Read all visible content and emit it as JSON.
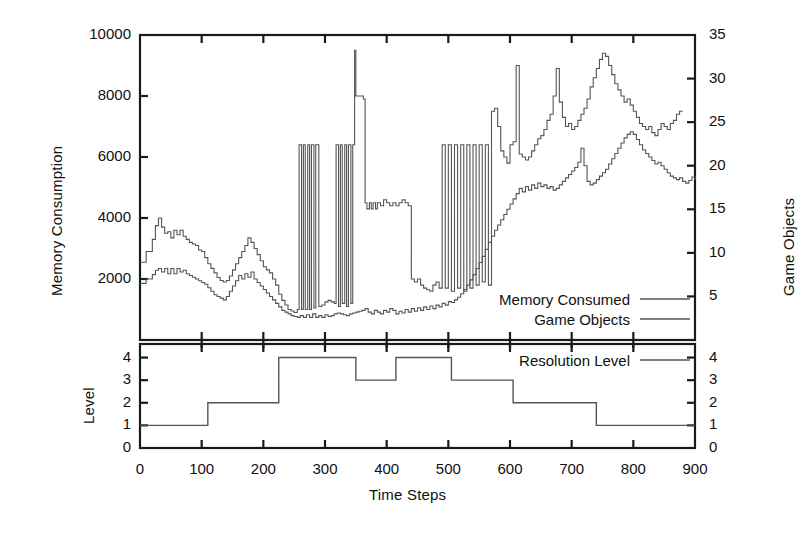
{
  "chart_data": {
    "type": "line",
    "title": "",
    "panels": [
      {
        "name": "upper-panel",
        "xlabel": "",
        "ylabel_left": "Memory Consumption",
        "ylabel_right": "Game Objects",
        "xlim": [
          0,
          900
        ],
        "ylim_left": [
          0,
          10000
        ],
        "ylim_right": [
          0,
          35
        ],
        "yticks_left": [
          2000,
          4000,
          6000,
          8000,
          10000
        ],
        "ytick_labels_left": [
          "2000",
          "4000",
          "6000",
          "8000",
          "10000"
        ],
        "yticks_right": [
          5,
          10,
          15,
          20,
          25,
          30,
          35
        ],
        "ytick_labels_right": [
          "5",
          "10",
          "15",
          "20",
          "25",
          "30",
          "35"
        ],
        "grid": false,
        "legend_position": "inside-bottom-right",
        "series": [
          {
            "name": "Memory Consumed",
            "axis": "left",
            "x": [
              0,
              10,
              20,
              25,
              30,
              35,
              40,
              45,
              50,
              55,
              60,
              65,
              70,
              75,
              80,
              85,
              90,
              95,
              100,
              105,
              110,
              115,
              120,
              125,
              130,
              135,
              140,
              145,
              150,
              155,
              160,
              165,
              170,
              175,
              180,
              185,
              190,
              195,
              200,
              205,
              210,
              215,
              220,
              225,
              230,
              235,
              240,
              245,
              250,
              255,
              258,
              262,
              265,
              268,
              272,
              275,
              278,
              282,
              285,
              290,
              295,
              300,
              305,
              310,
              315,
              318,
              322,
              325,
              328,
              332,
              335,
              338,
              342,
              345,
              348,
              350,
              352,
              355,
              358,
              362,
              365,
              368,
              372,
              375,
              378,
              382,
              385,
              390,
              395,
              400,
              405,
              410,
              415,
              420,
              425,
              430,
              435,
              440,
              445,
              450,
              455,
              460,
              465,
              470,
              475,
              480,
              485,
              490,
              495,
              500,
              505,
              510,
              515,
              520,
              525,
              530,
              535,
              540,
              545,
              550,
              555,
              560,
              565,
              570,
              575,
              580,
              585,
              590,
              595,
              600,
              605,
              610,
              615,
              620,
              625,
              630,
              635,
              640,
              645,
              650,
              655,
              660,
              665,
              670,
              675,
              680,
              685,
              690,
              695,
              700,
              705,
              710,
              715,
              720,
              725,
              730,
              735,
              740,
              745,
              750,
              755,
              760,
              765,
              770,
              775,
              780,
              785,
              790,
              795,
              800,
              805,
              810,
              815,
              820,
              825,
              830,
              835,
              840,
              845,
              850,
              855,
              860,
              865,
              870,
              875,
              880,
              885,
              890,
              895,
              900
            ],
            "y": [
              2550,
              2900,
              3300,
              3750,
              4000,
              3700,
              3500,
              3550,
              3350,
              3600,
              3450,
              3600,
              3400,
              3300,
              3200,
              3150,
              3100,
              2950,
              2900,
              2700,
              2500,
              2350,
              2200,
              2050,
              1950,
              1900,
              1950,
              2100,
              2300,
              2500,
              2700,
              2900,
              3100,
              3350,
              3200,
              3000,
              2800,
              2600,
              2400,
              2300,
              2200,
              2000,
              1800,
              1500,
              1300,
              1150,
              1000,
              950,
              900,
              1000,
              6400,
              1000,
              6400,
              1000,
              6400,
              1000,
              6400,
              1050,
              6400,
              1100,
              1150,
              1250,
              1300,
              1250,
              1200,
              6400,
              1100,
              6400,
              1200,
              6400,
              1100,
              6400,
              1200,
              6400,
              9500,
              8000,
              8000,
              8000,
              8000,
              7900,
              4500,
              4300,
              4500,
              4300,
              4500,
              4300,
              4500,
              4400,
              4600,
              4500,
              4400,
              4500,
              4400,
              4500,
              4600,
              4500,
              4400,
              2000,
              1900,
              2000,
              1800,
              1700,
              1650,
              1600,
              1800,
              1900,
              1700,
              6400,
              1700,
              6400,
              1600,
              6400,
              1700,
              6400,
              1600,
              6400,
              1700,
              6400,
              1800,
              6400,
              1900,
              6400,
              1800,
              7500,
              7600,
              7000,
              6200,
              6000,
              5800,
              6400,
              6500,
              9000,
              6100,
              6000,
              5900,
              6000,
              6200,
              6400,
              6600,
              6700,
              6900,
              7200,
              7400,
              8000,
              8900,
              7800,
              7300,
              7000,
              7100,
              6900,
              7000,
              7200,
              7400,
              7600,
              7900,
              8300,
              8600,
              8900,
              9200,
              9400,
              9300,
              9000,
              8700,
              8400,
              8200,
              8000,
              7800,
              7900,
              7700,
              7500,
              7300,
              7100,
              7000,
              6900,
              7000,
              6800,
              6700,
              6900,
              7100,
              7000,
              6900,
              7100,
              7200,
              7400,
              7500
            ],
            "style": "solid"
          },
          {
            "name": "Game Objects",
            "axis": "right",
            "x": [
              0,
              10,
              20,
              25,
              30,
              35,
              40,
              45,
              50,
              55,
              60,
              65,
              70,
              75,
              80,
              85,
              90,
              95,
              100,
              105,
              110,
              115,
              120,
              125,
              130,
              135,
              140,
              145,
              150,
              155,
              160,
              165,
              170,
              175,
              180,
              185,
              190,
              195,
              200,
              205,
              210,
              215,
              220,
              225,
              230,
              235,
              240,
              245,
              250,
              255,
              260,
              265,
              270,
              275,
              280,
              285,
              290,
              295,
              300,
              305,
              310,
              315,
              320,
              325,
              330,
              335,
              340,
              345,
              350,
              355,
              360,
              365,
              370,
              375,
              380,
              385,
              390,
              395,
              400,
              405,
              410,
              415,
              420,
              425,
              430,
              435,
              440,
              445,
              450,
              455,
              460,
              465,
              470,
              475,
              480,
              485,
              490,
              495,
              500,
              505,
              510,
              515,
              520,
              525,
              530,
              535,
              540,
              545,
              550,
              555,
              560,
              565,
              570,
              575,
              580,
              585,
              590,
              595,
              600,
              605,
              610,
              615,
              620,
              625,
              630,
              635,
              640,
              645,
              650,
              655,
              660,
              665,
              670,
              675,
              680,
              685,
              690,
              695,
              700,
              705,
              710,
              715,
              720,
              725,
              730,
              735,
              740,
              745,
              750,
              755,
              760,
              765,
              770,
              775,
              780,
              785,
              790,
              795,
              800,
              805,
              810,
              815,
              820,
              825,
              830,
              835,
              840,
              845,
              850,
              855,
              860,
              865,
              870,
              875,
              880,
              885,
              890,
              895,
              900
            ],
            "y": [
              6.5,
              7.0,
              7.5,
              8.0,
              8.2,
              7.8,
              8.2,
              7.6,
              8.2,
              7.6,
              8.2,
              7.8,
              8.0,
              7.6,
              7.4,
              7.2,
              7.0,
              6.8,
              6.6,
              6.4,
              6.0,
              5.6,
              5.2,
              5.0,
              4.8,
              4.6,
              5.0,
              5.6,
              6.2,
              6.8,
              7.4,
              7.0,
              7.6,
              7.2,
              7.8,
              7.0,
              6.6,
              6.2,
              5.8,
              5.4,
              5.0,
              4.6,
              4.2,
              3.8,
              3.4,
              3.2,
              3.0,
              2.8,
              2.7,
              2.6,
              2.8,
              2.6,
              2.9,
              2.6,
              3.0,
              2.6,
              2.8,
              2.6,
              2.9,
              2.7,
              2.8,
              3.0,
              3.1,
              3.0,
              2.9,
              2.8,
              3.0,
              3.1,
              3.2,
              3.3,
              3.4,
              3.6,
              3.2,
              3.0,
              3.4,
              3.2,
              3.0,
              3.4,
              3.2,
              3.6,
              3.4,
              3.0,
              3.3,
              3.1,
              3.5,
              3.2,
              3.6,
              3.3,
              3.7,
              3.4,
              3.8,
              3.5,
              3.9,
              3.6,
              4.0,
              3.8,
              4.2,
              4.0,
              4.4,
              4.3,
              4.6,
              4.9,
              5.3,
              5.8,
              6.3,
              6.9,
              7.5,
              8.2,
              8.9,
              9.6,
              10.4,
              11.2,
              11.9,
              12.6,
              13.2,
              13.8,
              14.4,
              15.0,
              15.6,
              16.2,
              16.8,
              17.4,
              17.0,
              17.6,
              17.2,
              17.8,
              17.4,
              18.0,
              17.6,
              17.8,
              17.4,
              17.6,
              17.2,
              17.4,
              17.8,
              18.2,
              18.6,
              19.0,
              19.4,
              19.8,
              20.4,
              22.0,
              20.0,
              18.2,
              17.8,
              18.0,
              18.4,
              18.8,
              19.2,
              19.6,
              20.2,
              20.8,
              21.4,
              22.0,
              22.6,
              23.2,
              23.6,
              23.9,
              23.6,
              23.0,
              22.4,
              21.8,
              21.4,
              21.0,
              20.6,
              20.2,
              20.4,
              20.0,
              19.6,
              19.2,
              18.8,
              18.6,
              18.4,
              18.6,
              18.2,
              18.0,
              18.3,
              18.7,
              18.4,
              18.2,
              18.6,
              18.9,
              19.2,
              19.4
            ],
            "style": "solid"
          }
        ]
      },
      {
        "name": "lower-panel",
        "xlabel": "Time Steps",
        "ylabel_left": "Level",
        "xlim": [
          0,
          900
        ],
        "ylim": [
          0,
          4.6
        ],
        "yticks": [
          0,
          1,
          2,
          3,
          4
        ],
        "ytick_labels_left": [
          "0",
          "1",
          "2",
          "3",
          "4"
        ],
        "ytick_labels_right": [
          "0",
          "1",
          "2",
          "3",
          "4"
        ],
        "grid": false,
        "legend_position": "inside-top-right",
        "series": [
          {
            "name": "Resolution Level",
            "type": "step",
            "steps": [
              {
                "x_start": 0,
                "x_end": 110,
                "level": 1
              },
              {
                "x_start": 110,
                "x_end": 225,
                "level": 2
              },
              {
                "x_start": 225,
                "x_end": 350,
                "level": 4
              },
              {
                "x_start": 350,
                "x_end": 415,
                "level": 3
              },
              {
                "x_start": 415,
                "x_end": 505,
                "level": 4
              },
              {
                "x_start": 505,
                "x_end": 605,
                "level": 3
              },
              {
                "x_start": 605,
                "x_end": 740,
                "level": 2
              },
              {
                "x_start": 740,
                "x_end": 900,
                "level": 1
              }
            ],
            "style": "solid"
          }
        ]
      }
    ],
    "xticks": [
      0,
      100,
      200,
      300,
      400,
      500,
      600,
      700,
      800,
      900
    ],
    "xtick_labels": [
      "0",
      "100",
      "200",
      "300",
      "400",
      "500",
      "600",
      "700",
      "800",
      "900"
    ],
    "colors": {
      "axis": "#1a1a1a",
      "memory_line": "#555555",
      "objects_line": "#555555",
      "resolution_line": "#555555",
      "background": "#ffffff"
    }
  },
  "labels": {
    "y_left_upper": "Memory Consumption",
    "y_right_upper": "Game Objects",
    "y_left_lower": "Level",
    "x_axis": "Time Steps"
  },
  "legend_upper": [
    {
      "label": "Memory Consumed"
    },
    {
      "label": "Game Objects"
    }
  ],
  "legend_lower": [
    {
      "label": "Resolution Level"
    }
  ]
}
